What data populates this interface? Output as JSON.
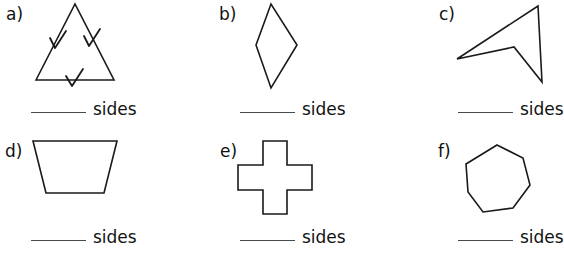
{
  "page": {
    "background_color": "#ffffff",
    "ink_color": "#111111",
    "rule_color": "#4a4a4a"
  },
  "answer_unit_label": "sides",
  "problems": [
    {
      "letter": "a)",
      "shape_name": "equilateral-triangle-with-tick-marks",
      "sides": 3,
      "answer_blank": "",
      "unit": "sides"
    },
    {
      "letter": "b)",
      "shape_name": "rhombus",
      "sides": 4,
      "answer_blank": "",
      "unit": "sides"
    },
    {
      "letter": "c)",
      "shape_name": "concave-arrowhead-quadrilateral",
      "sides": 4,
      "answer_blank": "",
      "unit": "sides"
    },
    {
      "letter": "d)",
      "shape_name": "trapezoid",
      "sides": 4,
      "answer_blank": "",
      "unit": "sides"
    },
    {
      "letter": "e)",
      "shape_name": "cross-plus-polygon",
      "sides": 12,
      "answer_blank": "",
      "unit": "sides"
    },
    {
      "letter": "f)",
      "shape_name": "heptagon",
      "sides": 7,
      "answer_blank": "",
      "unit": "sides"
    }
  ]
}
